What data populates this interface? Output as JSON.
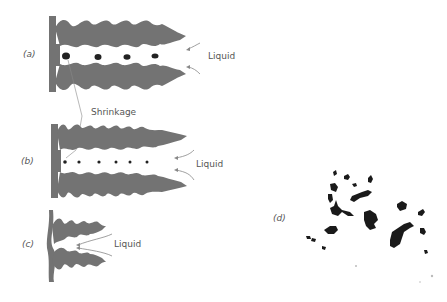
{
  "figure": {
    "panels": [
      {
        "id": "a",
        "label": "(a)",
        "annotations": [
          "Liquid",
          "Shrinkage"
        ]
      },
      {
        "id": "b",
        "label": "(b)",
        "annotations": [
          "Liquid"
        ]
      },
      {
        "id": "c",
        "label": "(c)",
        "annotations": [
          "Liquid"
        ]
      },
      {
        "id": "d",
        "label": "(d)",
        "annotations": []
      }
    ],
    "labels": {
      "panel_a": "(a)",
      "panel_b": "(b)",
      "panel_c": "(c)",
      "panel_d": "(d)",
      "liquid_a": "Liquid",
      "liquid_b": "Liquid",
      "liquid_c": "Liquid",
      "shrinkage": "Shrinkage"
    },
    "colors": {
      "solid": "#737373",
      "pore": "#222222",
      "arrow": "#888888",
      "text": "#555555",
      "micrograph": "#1a1a1a"
    }
  }
}
